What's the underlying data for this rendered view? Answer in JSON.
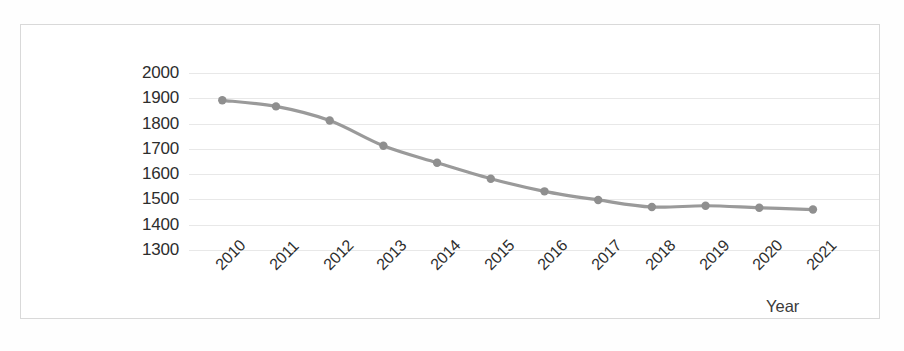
{
  "chart_data": {
    "type": "line",
    "title": "",
    "xlabel": "Year",
    "ylabel": "Price (€/sqm)",
    "categories": [
      "2010",
      "2011",
      "2012",
      "2013",
      "2014",
      "2015",
      "2016",
      "2017",
      "2018",
      "2019",
      "2020",
      "2021"
    ],
    "values": [
      1892,
      1868,
      1812,
      1712,
      1645,
      1582,
      1532,
      1498,
      1470,
      1475,
      1467,
      1460
    ],
    "series": [
      {
        "name": "Price (€/sqm)",
        "values": [
          1892,
          1868,
          1812,
          1712,
          1645,
          1582,
          1532,
          1498,
          1470,
          1475,
          1467,
          1460
        ]
      }
    ],
    "ylim": [
      1300,
      2000
    ],
    "ytick_step": 100,
    "yticks": [
      "2000",
      "1900",
      "1800",
      "1700",
      "1600",
      "1500",
      "1400",
      "1300"
    ],
    "grid": true,
    "grid_axis": "y",
    "legend": false,
    "legend_position": "none",
    "xtick_rotation": -45,
    "marker": "circle",
    "line_color": "#9a9a9a",
    "marker_color": "#8f8f8f",
    "gridline_color": "#e8e8e8",
    "plot_background": "#ffffff",
    "border_color": "#d9d9d9",
    "annotations": []
  }
}
